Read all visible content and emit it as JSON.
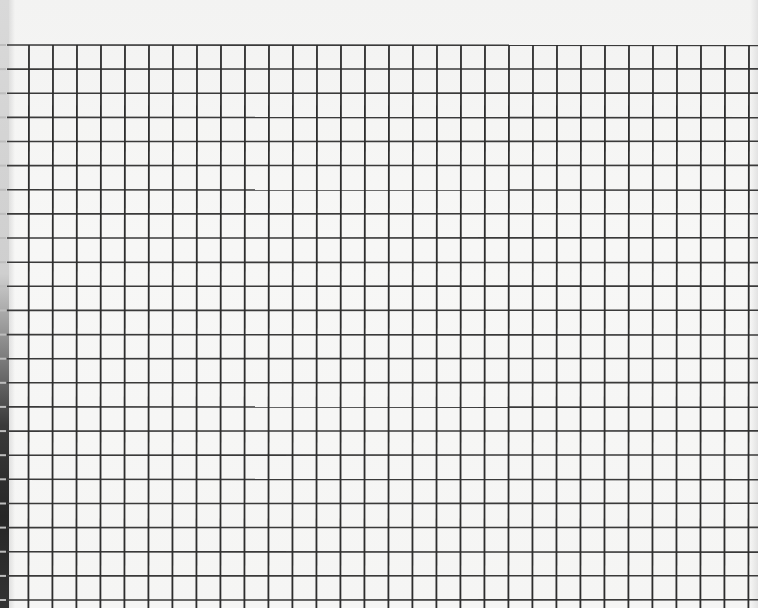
{
  "image": {
    "subject": "graph-paper-photo",
    "width": 758,
    "height": 608
  },
  "grid": {
    "top": 45,
    "bottom": 608,
    "left": 7,
    "right": 758,
    "first_vertical_x": 29,
    "vertical_pitch": 24.0,
    "vertical_count": 31,
    "first_horizontal_y": 45,
    "horizontal_pitch": 24.13,
    "horizontal_count": 24,
    "line_color": "#333333",
    "paper_color": "#f6f6f5"
  }
}
